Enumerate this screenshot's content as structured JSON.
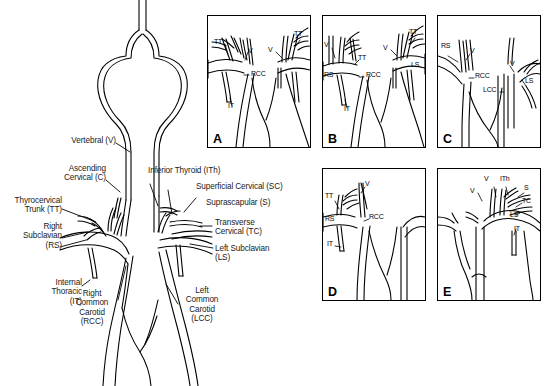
{
  "figure": {
    "type": "anatomical-line-diagram",
    "background_color": "#ffffff",
    "line_color": "#000000"
  },
  "main_diagram": {
    "name": "aortic-arch-and-subclavian-overview",
    "labels_left": [
      {
        "id": "vertebral",
        "text": "Vertebral (V)",
        "abbr": "V"
      },
      {
        "id": "ascending-cervical",
        "text": "Ascending\nCervical (C)",
        "abbr": "C"
      },
      {
        "id": "thyrocervical-trunk",
        "text": "Thyrocervical\nTrunk (TT)",
        "abbr": "TT"
      },
      {
        "id": "right-subclavian",
        "text": "Right\nSubclavian\n(RS)",
        "abbr": "RS"
      },
      {
        "id": "internal-thoracic",
        "text": "Internal\nThoracic\n(IT)",
        "abbr": "IT"
      },
      {
        "id": "right-common-carotid",
        "text": "Right\nCommon\nCarotid\n(RCC)",
        "abbr": "RCC"
      }
    ],
    "labels_right": [
      {
        "id": "inferior-thyroid",
        "text": "Inferior Thyroid (ITh)",
        "abbr": "ITh"
      },
      {
        "id": "superficial-cervical",
        "text": "Superficial Cervical (SC)",
        "abbr": "SC"
      },
      {
        "id": "suprascapular",
        "text": "Suprascapular (S)",
        "abbr": "S"
      },
      {
        "id": "transverse-cervical",
        "text": "Transverse\nCervical (TC)",
        "abbr": "TC"
      },
      {
        "id": "left-subclavian",
        "text": "Left Subclavian\n(LS)",
        "abbr": "LS"
      },
      {
        "id": "left-common-carotid",
        "text": "Left\nCommon\nCarotid\n(LCC)",
        "abbr": "LCC"
      }
    ]
  },
  "panels": [
    {
      "letter": "A",
      "name": "panel-a",
      "callouts": [
        {
          "abbr": "TT",
          "x": 10,
          "y": 26
        },
        {
          "abbr": "V",
          "x": 38,
          "y": 34
        },
        {
          "abbr": "RCC",
          "x": 43,
          "y": 59
        },
        {
          "abbr": "IT",
          "x": 18,
          "y": 92
        },
        {
          "abbr": "V",
          "x": 62,
          "y": 32
        },
        {
          "abbr": "TT",
          "x": 88,
          "y": 18
        }
      ]
    },
    {
      "letter": "B",
      "name": "panel-b",
      "callouts": [
        {
          "abbr": "V",
          "x": 4,
          "y": 28
        },
        {
          "abbr": "TT",
          "x": 36,
          "y": 42
        },
        {
          "abbr": "RS",
          "x": 3,
          "y": 62
        },
        {
          "abbr": "RCC",
          "x": 42,
          "y": 60
        },
        {
          "abbr": "IT",
          "x": 21,
          "y": 93
        },
        {
          "abbr": "V",
          "x": 62,
          "y": 32
        },
        {
          "abbr": "TT",
          "x": 88,
          "y": 17
        },
        {
          "abbr": "LS",
          "x": 89,
          "y": 51
        }
      ]
    },
    {
      "letter": "C",
      "name": "panel-c",
      "callouts": [
        {
          "abbr": "RS",
          "x": 5,
          "y": 30
        },
        {
          "abbr": "V",
          "x": 31,
          "y": 35
        },
        {
          "abbr": "RCC",
          "x": 37,
          "y": 58
        },
        {
          "abbr": "LCC",
          "x": 47,
          "y": 73
        },
        {
          "abbr": "V",
          "x": 73,
          "y": 50
        },
        {
          "abbr": "LS",
          "x": 88,
          "y": 63
        }
      ]
    },
    {
      "letter": "D",
      "name": "panel-d",
      "callouts": [
        {
          "abbr": "TT",
          "x": 5,
          "y": 27
        },
        {
          "abbr": "V",
          "x": 41,
          "y": 14
        },
        {
          "abbr": "RS",
          "x": 4,
          "y": 52
        },
        {
          "abbr": "RCC",
          "x": 46,
          "y": 46
        },
        {
          "abbr": "IT",
          "x": 7,
          "y": 73
        }
      ]
    },
    {
      "letter": "E",
      "name": "panel-e",
      "callouts": [
        {
          "abbr": "V",
          "x": 47,
          "y": 10
        },
        {
          "abbr": "ITh",
          "x": 64,
          "y": 10
        },
        {
          "abbr": "S",
          "x": 85,
          "y": 19
        },
        {
          "abbr": "V",
          "x": 34,
          "y": 21
        },
        {
          "abbr": "TC",
          "x": 84,
          "y": 31
        },
        {
          "abbr": "LS",
          "x": 73,
          "y": 45
        },
        {
          "abbr": "IT",
          "x": 76,
          "y": 58
        }
      ]
    }
  ]
}
